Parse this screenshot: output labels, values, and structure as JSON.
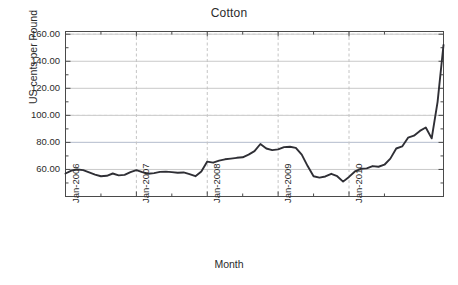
{
  "chart_data": {
    "type": "line",
    "title": "Cotton",
    "xlabel": "Month",
    "ylabel": "US cents per Pound",
    "ylim": [
      40,
      162
    ],
    "ytick_labels": [
      "160.00",
      "140.00",
      "120.00",
      "100.00",
      "80.00",
      "60.00"
    ],
    "ytick_values": [
      160,
      140,
      120,
      100,
      80,
      60
    ],
    "yminor_values": [
      150,
      130,
      110,
      90,
      70,
      50
    ],
    "xtick_labels": [
      "Jan-2006",
      "Jan-2007",
      "Jan-2008",
      "Jan-2009",
      "Jan-2010"
    ],
    "xtick_indices": [
      0,
      12,
      24,
      36,
      48
    ],
    "xminor_indices": [
      6,
      18,
      30,
      42,
      54
    ],
    "grid": true,
    "legend": "none",
    "series": [
      {
        "name": "Cotton price",
        "color": "#2f2f35",
        "x": [
          "Jan-2006",
          "Feb-2006",
          "Mar-2006",
          "Apr-2006",
          "May-2006",
          "Jun-2006",
          "Jul-2006",
          "Aug-2006",
          "Sep-2006",
          "Oct-2006",
          "Nov-2006",
          "Dec-2006",
          "Jan-2007",
          "Feb-2007",
          "Mar-2007",
          "Apr-2007",
          "May-2007",
          "Jun-2007",
          "Jul-2007",
          "Aug-2007",
          "Sep-2007",
          "Oct-2007",
          "Nov-2007",
          "Dec-2007",
          "Jan-2008",
          "Feb-2008",
          "Mar-2008",
          "Apr-2008",
          "May-2008",
          "Jun-2008",
          "Jul-2008",
          "Aug-2008",
          "Sep-2008",
          "Oct-2008",
          "Nov-2008",
          "Dec-2008",
          "Jan-2009",
          "Feb-2009",
          "Mar-2009",
          "Apr-2009",
          "May-2009",
          "Jun-2009",
          "Jul-2009",
          "Aug-2009",
          "Sep-2009",
          "Oct-2009",
          "Nov-2009",
          "Dec-2009",
          "Jan-2010",
          "Feb-2010",
          "Mar-2010",
          "Apr-2010",
          "May-2010",
          "Jun-2010",
          "Jul-2010",
          "Aug-2010",
          "Sep-2010",
          "Oct-2010",
          "Nov-2010"
        ],
        "values": [
          57.0,
          59.2,
          60.0,
          59.5,
          57.8,
          56.2,
          55.0,
          55.3,
          57.0,
          55.6,
          56.0,
          58.0,
          59.5,
          58.0,
          56.8,
          57.3,
          58.2,
          58.4,
          58.0,
          57.6,
          57.8,
          56.5,
          55.0,
          58.5,
          65.8,
          65.0,
          66.5,
          67.5,
          68.0,
          68.6,
          69.0,
          71.0,
          73.5,
          78.8,
          75.5,
          74.3,
          74.8,
          76.5,
          76.8,
          76.0,
          71.0,
          62.5,
          55.0,
          54.0,
          54.8,
          56.8,
          55.0,
          51.0,
          54.5,
          58.5,
          60.5,
          60.8,
          62.5,
          62.0,
          63.5,
          68.0,
          75.5,
          77.0,
          83.5
        ]
      }
    ],
    "annotations": {
      "peak_2008": 78.8,
      "trough_2009": 51.0,
      "local_peak_2010": 91.0,
      "dip_after_peak_2010": 83.0,
      "final_value": 152.0
    },
    "extra_points": [
      {
        "label": "Jul-2010 rise",
        "value": 85.0
      },
      {
        "label": "Aug-2010",
        "value": 88.5
      },
      {
        "label": "Sep-2010 peak",
        "value": 91.0
      },
      {
        "label": "Oct-2010 dip",
        "value": 83.0
      },
      {
        "label": "Nov-2010",
        "value": 110.0
      },
      {
        "label": "Dec-2010",
        "value": 152.0
      }
    ]
  },
  "colors": {
    "line": "#2f2f35",
    "grid_horizontal": "#c9c9c9",
    "grid_vertical": "#c4c4c4",
    "axis": "#4a4a4a",
    "text": "#2b2b2b",
    "background": "#ffffff"
  }
}
